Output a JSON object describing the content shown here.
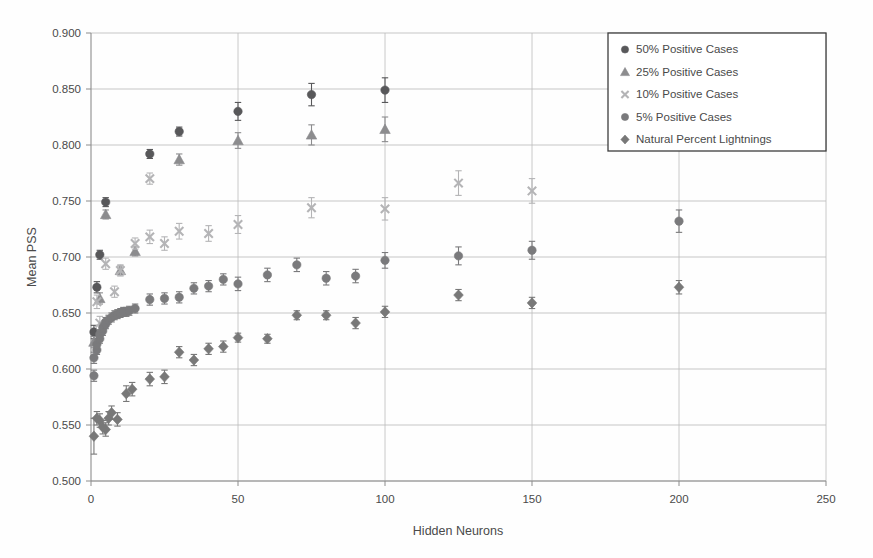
{
  "figure": {
    "title": "",
    "background": "#fefefe"
  },
  "axes": {
    "xlabel": "Hidden Neurons",
    "ylabel": "Mean PSS",
    "x_ticks": [
      "0",
      "50",
      "100",
      "150",
      "200",
      "250"
    ],
    "y_ticks": [
      "0.500",
      "0.550",
      "0.600",
      "0.650",
      "0.700",
      "0.750",
      "0.800",
      "0.850",
      "0.900"
    ]
  },
  "legend": {
    "position": "top-right",
    "entries": [
      {
        "label": "50% Positive Cases",
        "marker": "circle-dark",
        "color": "#58585a"
      },
      {
        "label": "25% Positive Cases",
        "marker": "triangle",
        "color": "#8c8c8e"
      },
      {
        "label": "10% Positive Cases",
        "marker": "x-cross",
        "color": "#b4b4b6"
      },
      {
        "label": "5% Positive Cases",
        "marker": "circle-gray",
        "color": "#7a7a7c"
      },
      {
        "label": "Natural Percent Lightnings",
        "marker": "diamond",
        "color": "#787878"
      }
    ]
  },
  "chart_data": {
    "type": "scatter",
    "title": "",
    "xlabel": "Hidden Neurons",
    "ylabel": "Mean PSS",
    "xlim": [
      0,
      250
    ],
    "ylim": [
      0.5,
      0.9
    ],
    "xtick_step": 50,
    "ytick_step": 0.05,
    "grid": true,
    "error_bars": true,
    "legend_position": "top-right",
    "series": [
      {
        "name": "50% Positive Cases",
        "marker": "circle-dark",
        "color": "#58585a",
        "points": [
          {
            "x": 1,
            "y": 0.633,
            "err": 0.006
          },
          {
            "x": 2,
            "y": 0.673,
            "err": 0.005
          },
          {
            "x": 3,
            "y": 0.702,
            "err": 0.004
          },
          {
            "x": 5,
            "y": 0.749,
            "err": 0.004
          },
          {
            "x": 20,
            "y": 0.792,
            "err": 0.004
          },
          {
            "x": 30,
            "y": 0.812,
            "err": 0.004
          },
          {
            "x": 50,
            "y": 0.83,
            "err": 0.008
          },
          {
            "x": 75,
            "y": 0.845,
            "err": 0.01
          },
          {
            "x": 100,
            "y": 0.849,
            "err": 0.011
          }
        ]
      },
      {
        "name": "25% Positive Cases",
        "marker": "triangle",
        "color": "#8c8c8e",
        "points": [
          {
            "x": 1,
            "y": 0.624,
            "err": 0.005
          },
          {
            "x": 3,
            "y": 0.663,
            "err": 0.005
          },
          {
            "x": 5,
            "y": 0.738,
            "err": 0.004
          },
          {
            "x": 10,
            "y": 0.688,
            "err": 0.004
          },
          {
            "x": 15,
            "y": 0.705,
            "err": 0.004
          },
          {
            "x": 30,
            "y": 0.787,
            "err": 0.005
          },
          {
            "x": 50,
            "y": 0.804,
            "err": 0.007
          },
          {
            "x": 75,
            "y": 0.809,
            "err": 0.009
          },
          {
            "x": 100,
            "y": 0.814,
            "err": 0.011
          }
        ]
      },
      {
        "name": "10% Positive Cases",
        "marker": "x-cross",
        "color": "#b4b4b6",
        "points": [
          {
            "x": 2,
            "y": 0.66,
            "err": 0.006
          },
          {
            "x": 3,
            "y": 0.641,
            "err": 0.006
          },
          {
            "x": 5,
            "y": 0.694,
            "err": 0.005
          },
          {
            "x": 8,
            "y": 0.669,
            "err": 0.005
          },
          {
            "x": 10,
            "y": 0.688,
            "err": 0.005
          },
          {
            "x": 15,
            "y": 0.712,
            "err": 0.005
          },
          {
            "x": 20,
            "y": 0.718,
            "err": 0.006
          },
          {
            "x": 20,
            "y": 0.77,
            "err": 0.005
          },
          {
            "x": 25,
            "y": 0.712,
            "err": 0.006
          },
          {
            "x": 30,
            "y": 0.723,
            "err": 0.007
          },
          {
            "x": 40,
            "y": 0.721,
            "err": 0.007
          },
          {
            "x": 50,
            "y": 0.729,
            "err": 0.008
          },
          {
            "x": 75,
            "y": 0.744,
            "err": 0.009
          },
          {
            "x": 100,
            "y": 0.743,
            "err": 0.01
          },
          {
            "x": 125,
            "y": 0.766,
            "err": 0.011
          },
          {
            "x": 150,
            "y": 0.759,
            "err": 0.011
          }
        ]
      },
      {
        "name": "5% Positive Cases",
        "marker": "circle-gray",
        "color": "#7a7a7c",
        "points": [
          {
            "x": 1,
            "y": 0.594,
            "err": 0.005
          },
          {
            "x": 1,
            "y": 0.61,
            "err": 0.005
          },
          {
            "x": 2,
            "y": 0.617,
            "err": 0.004
          },
          {
            "x": 2,
            "y": 0.622,
            "err": 0.004
          },
          {
            "x": 3,
            "y": 0.627,
            "err": 0.004
          },
          {
            "x": 3,
            "y": 0.631,
            "err": 0.004
          },
          {
            "x": 4,
            "y": 0.634,
            "err": 0.004
          },
          {
            "x": 4,
            "y": 0.637,
            "err": 0.004
          },
          {
            "x": 5,
            "y": 0.64,
            "err": 0.004
          },
          {
            "x": 5,
            "y": 0.642,
            "err": 0.004
          },
          {
            "x": 6,
            "y": 0.644,
            "err": 0.004
          },
          {
            "x": 7,
            "y": 0.646,
            "err": 0.004
          },
          {
            "x": 8,
            "y": 0.648,
            "err": 0.004
          },
          {
            "x": 9,
            "y": 0.649,
            "err": 0.004
          },
          {
            "x": 10,
            "y": 0.65,
            "err": 0.004
          },
          {
            "x": 11,
            "y": 0.651,
            "err": 0.004
          },
          {
            "x": 12,
            "y": 0.651,
            "err": 0.004
          },
          {
            "x": 13,
            "y": 0.652,
            "err": 0.004
          },
          {
            "x": 15,
            "y": 0.654,
            "err": 0.004
          },
          {
            "x": 20,
            "y": 0.662,
            "err": 0.005
          },
          {
            "x": 25,
            "y": 0.663,
            "err": 0.005
          },
          {
            "x": 30,
            "y": 0.664,
            "err": 0.005
          },
          {
            "x": 35,
            "y": 0.672,
            "err": 0.005
          },
          {
            "x": 40,
            "y": 0.674,
            "err": 0.005
          },
          {
            "x": 45,
            "y": 0.68,
            "err": 0.005
          },
          {
            "x": 50,
            "y": 0.676,
            "err": 0.006
          },
          {
            "x": 60,
            "y": 0.684,
            "err": 0.006
          },
          {
            "x": 70,
            "y": 0.693,
            "err": 0.006
          },
          {
            "x": 80,
            "y": 0.681,
            "err": 0.006
          },
          {
            "x": 90,
            "y": 0.683,
            "err": 0.006
          },
          {
            "x": 100,
            "y": 0.697,
            "err": 0.007
          },
          {
            "x": 125,
            "y": 0.701,
            "err": 0.008
          },
          {
            "x": 150,
            "y": 0.706,
            "err": 0.008
          },
          {
            "x": 200,
            "y": 0.732,
            "err": 0.01
          }
        ]
      },
      {
        "name": "Natural Percent Lightnings",
        "marker": "diamond",
        "color": "#787878",
        "points": [
          {
            "x": 1,
            "y": 0.54,
            "err": 0.016
          },
          {
            "x": 2,
            "y": 0.556,
            "err": 0.006
          },
          {
            "x": 3,
            "y": 0.554,
            "err": 0.006
          },
          {
            "x": 4,
            "y": 0.548,
            "err": 0.006
          },
          {
            "x": 5,
            "y": 0.546,
            "err": 0.006
          },
          {
            "x": 6,
            "y": 0.556,
            "err": 0.006
          },
          {
            "x": 7,
            "y": 0.561,
            "err": 0.006
          },
          {
            "x": 9,
            "y": 0.555,
            "err": 0.006
          },
          {
            "x": 12,
            "y": 0.578,
            "err": 0.007
          },
          {
            "x": 14,
            "y": 0.582,
            "err": 0.006
          },
          {
            "x": 20,
            "y": 0.591,
            "err": 0.006
          },
          {
            "x": 25,
            "y": 0.593,
            "err": 0.006
          },
          {
            "x": 30,
            "y": 0.615,
            "err": 0.005
          },
          {
            "x": 35,
            "y": 0.608,
            "err": 0.005
          },
          {
            "x": 40,
            "y": 0.618,
            "err": 0.005
          },
          {
            "x": 45,
            "y": 0.62,
            "err": 0.005
          },
          {
            "x": 50,
            "y": 0.628,
            "err": 0.004
          },
          {
            "x": 60,
            "y": 0.627,
            "err": 0.004
          },
          {
            "x": 70,
            "y": 0.648,
            "err": 0.004
          },
          {
            "x": 80,
            "y": 0.648,
            "err": 0.004
          },
          {
            "x": 90,
            "y": 0.641,
            "err": 0.005
          },
          {
            "x": 100,
            "y": 0.651,
            "err": 0.005
          },
          {
            "x": 125,
            "y": 0.666,
            "err": 0.005
          },
          {
            "x": 150,
            "y": 0.659,
            "err": 0.005
          },
          {
            "x": 200,
            "y": 0.673,
            "err": 0.006
          }
        ]
      }
    ]
  }
}
